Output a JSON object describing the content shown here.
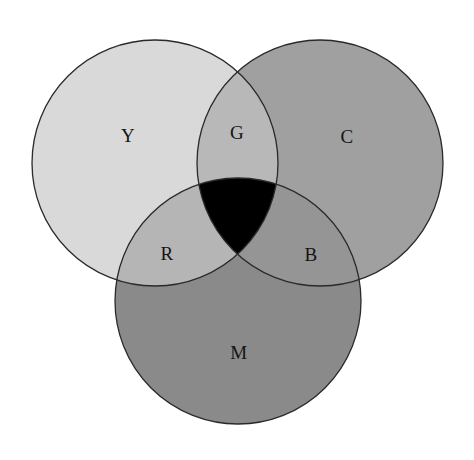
{
  "figure": {
    "type": "venn-diagram",
    "set_count": 3,
    "background_color": "#ffffff",
    "outline_color": "#2a2a2a",
    "outline_width": 1.3,
    "label_color": "#141414",
    "label_font_size": 19
  },
  "circles": [
    {
      "id": "circle-yellow",
      "name": "yellow-circle",
      "cx": 155,
      "cy": 163,
      "r": 123,
      "fill": "#d9d9d9"
    },
    {
      "id": "circle-cyan",
      "name": "cyan-circle",
      "cx": 320,
      "cy": 163,
      "r": 123,
      "fill": "#a0a0a0"
    },
    {
      "id": "circle-magenta",
      "name": "magenta-circle",
      "cx": 238,
      "cy": 301,
      "r": 123,
      "fill": "#8a8a8a"
    }
  ],
  "regions": [
    {
      "id": "region-y",
      "label": "Y",
      "name": "region-label-y",
      "description": "yellow only",
      "x": 128,
      "y": 138,
      "fill": "#d9d9d9"
    },
    {
      "id": "region-c",
      "label": "C",
      "name": "region-label-c",
      "description": "cyan only",
      "x": 347,
      "y": 139,
      "fill": "#a0a0a0"
    },
    {
      "id": "region-m",
      "label": "M",
      "name": "region-label-m",
      "description": "magenta only",
      "x": 239,
      "y": 355,
      "fill": "#8a8a8a"
    },
    {
      "id": "region-g",
      "label": "G",
      "name": "region-label-g",
      "description": "yellow and cyan overlap",
      "x": 237,
      "y": 135,
      "fill": "#b8b8b8"
    },
    {
      "id": "region-r",
      "label": "R",
      "name": "region-label-r",
      "description": "yellow and magenta overlap",
      "x": 167,
      "y": 256,
      "fill": "#b5b5b5"
    },
    {
      "id": "region-b",
      "label": "B",
      "name": "region-label-b",
      "description": "cyan and magenta overlap",
      "x": 311,
      "y": 257,
      "fill": "#959595"
    },
    {
      "id": "region-center",
      "label": "",
      "name": "region-center-all",
      "description": "all three overlap",
      "x": 238,
      "y": 212,
      "fill": "#000000"
    }
  ],
  "chart_data": {
    "type": "venn",
    "title": "",
    "xlabel": "",
    "ylabel": "",
    "sets": [
      "Y",
      "C",
      "M"
    ],
    "set_labels": [
      "Y",
      "C",
      "M"
    ],
    "intersections": [
      {
        "sets": [
          "Y",
          "C"
        ],
        "label": "G"
      },
      {
        "sets": [
          "Y",
          "M"
        ],
        "label": "R"
      },
      {
        "sets": [
          "C",
          "M"
        ],
        "label": "B"
      },
      {
        "sets": [
          "Y",
          "C",
          "M"
        ],
        "label": ""
      }
    ],
    "colors": {
      "Y": "#d9d9d9",
      "C": "#a0a0a0",
      "M": "#8a8a8a",
      "YC": "#b8b8b8",
      "YM": "#b5b5b5",
      "CM": "#959595",
      "YCM": "#000000"
    },
    "legend": "none",
    "grid": false
  }
}
